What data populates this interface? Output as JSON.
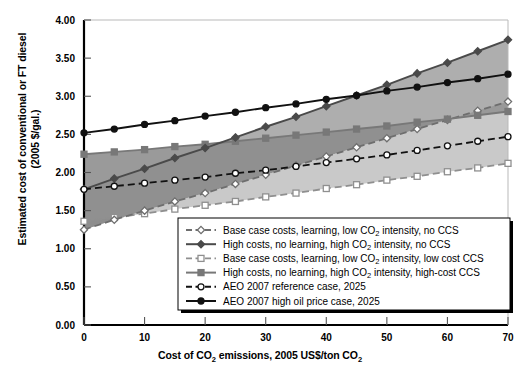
{
  "chart_data": {
    "type": "line",
    "title": "",
    "xlabel": "Cost of CO2 emissions, 2005 US$/ton CO2",
    "xlabel_parts": {
      "pre": "Cost of CO",
      "sub1": "2",
      "mid": " emissions, 2005 US$/ton CO",
      "sub2": "2"
    },
    "ylabel": "Estimated cost of conventional or FT diesel (2005 $/gal.)",
    "ylabel_line1": "Estimated cost of conventional or FT diesel",
    "ylabel_line2": "(2005 $/gal.)",
    "xlim": [
      0,
      70
    ],
    "ylim": [
      0,
      4.0
    ],
    "xticks": [
      0,
      10,
      20,
      30,
      40,
      50,
      60,
      70
    ],
    "yticks": [
      "0.00",
      "0.50",
      "1.00",
      "1.50",
      "2.00",
      "2.50",
      "3.00",
      "3.50",
      "4.00"
    ],
    "ytick_values": [
      0,
      0.5,
      1.0,
      1.5,
      2.0,
      2.5,
      3.0,
      3.5,
      4.0
    ],
    "grid": false,
    "legend_position": "inside-lower-right",
    "x": [
      0,
      5,
      10,
      15,
      20,
      25,
      30,
      35,
      40,
      45,
      50,
      55,
      60,
      65,
      70
    ],
    "series": [
      {
        "name": "Base case costs, learning, low CO2 intensity, no CCS",
        "label_parts": {
          "pre": "Base case costs, learning, low CO",
          "sub": "2",
          "post": " intensity, no CCS"
        },
        "marker": "open-diamond",
        "line": "dashed",
        "color": "#6e6e6e",
        "marker_fill": "#ffffff",
        "values": [
          1.25,
          1.38,
          1.5,
          1.62,
          1.73,
          1.85,
          1.97,
          2.09,
          2.21,
          2.33,
          2.45,
          2.57,
          2.69,
          2.81,
          2.93
        ]
      },
      {
        "name": "High costs, no learning, high CO2 intensity, no CCS",
        "label_parts": {
          "pre": "High costs, no learning, high CO",
          "sub": "2",
          "post": " intensity, no CCS"
        },
        "marker": "filled-diamond",
        "line": "solid",
        "color": "#4a4a4a",
        "marker_fill": "#4a4a4a",
        "values": [
          1.78,
          1.92,
          2.05,
          2.19,
          2.32,
          2.46,
          2.6,
          2.73,
          2.87,
          3.01,
          3.15,
          3.3,
          3.44,
          3.59,
          3.74
        ]
      },
      {
        "name": "Base case costs, learning, low CO2 intensity, low cost CCS",
        "label_parts": {
          "pre": "Base case costs, learning, low CO",
          "sub": "2",
          "post": " intensity, low cost CCS"
        },
        "marker": "open-square",
        "line": "dashed",
        "color": "#8f8f8f",
        "marker_fill": "#ffffff",
        "values": [
          1.36,
          1.41,
          1.46,
          1.52,
          1.57,
          1.62,
          1.68,
          1.73,
          1.79,
          1.84,
          1.9,
          1.95,
          2.01,
          2.06,
          2.12
        ]
      },
      {
        "name": "High costs, no learning, high CO2 intensity, high-cost CCS",
        "label_parts": {
          "pre": "High costs, no learning, high CO",
          "sub": "2",
          "post": " intensity, high-cost CCS"
        },
        "marker": "filled-square",
        "line": "solid",
        "color": "#787878",
        "marker_fill": "#787878",
        "values": [
          2.24,
          2.27,
          2.3,
          2.34,
          2.37,
          2.41,
          2.45,
          2.49,
          2.53,
          2.57,
          2.61,
          2.66,
          2.7,
          2.75,
          2.8
        ]
      },
      {
        "name": "AEO 2007 reference case, 2025",
        "label_parts": {
          "pre": "AEO 2007 reference case, 2025",
          "sub": "",
          "post": ""
        },
        "marker": "open-circle",
        "line": "dashed",
        "color": "#111111",
        "marker_fill": "#ffffff",
        "values": [
          1.78,
          1.82,
          1.86,
          1.9,
          1.94,
          1.99,
          2.03,
          2.08,
          2.13,
          2.18,
          2.23,
          2.29,
          2.35,
          2.41,
          2.47
        ]
      },
      {
        "name": "AEO 2007 high oil price case, 2025",
        "label_parts": {
          "pre": "AEO 2007 high oil price case, 2025",
          "sub": "",
          "post": ""
        },
        "marker": "filled-circle",
        "line": "solid",
        "color": "#111111",
        "marker_fill": "#111111",
        "values": [
          2.52,
          2.57,
          2.63,
          2.68,
          2.74,
          2.79,
          2.85,
          2.9,
          2.96,
          3.01,
          3.07,
          3.12,
          3.18,
          3.23,
          3.29
        ]
      }
    ],
    "bands": [
      {
        "name": "band-upper-dark",
        "color": "#9c9c9c"
      },
      {
        "name": "band-mid-dark",
        "color": "#8a8a8a"
      },
      {
        "name": "band-lower-light",
        "color": "#c9c9c9"
      }
    ]
  }
}
